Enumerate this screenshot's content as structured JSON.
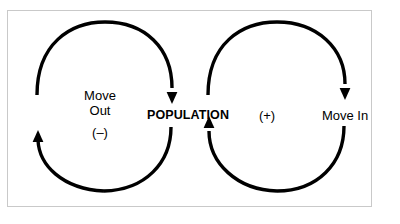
{
  "diagram": {
    "type": "causal-loop-diagram",
    "frame": {
      "border_color": "#c9c9c9",
      "background_color": "#ffffff"
    },
    "stroke_color": "#000000",
    "labels": {
      "center": "POPULATION",
      "left_label_line1": "Move",
      "left_label_line2": "Out",
      "left_sign": "(–)",
      "right_sign": "(+)",
      "right_label": "Move In"
    },
    "loops": [
      {
        "name": "move-out-loop",
        "side": "left",
        "polarity": "(–)",
        "label": "Move Out",
        "direction": "clockwise",
        "arrowheads": [
          "down-into-population",
          "up-on-left-side"
        ]
      },
      {
        "name": "move-in-loop",
        "side": "right",
        "polarity": "(+)",
        "label": "Move In",
        "direction": "clockwise",
        "arrowheads": [
          "down-on-right-side",
          "up-into-population"
        ]
      }
    ]
  }
}
